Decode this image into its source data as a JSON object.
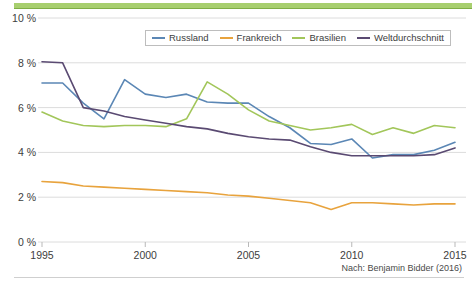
{
  "chart_data": {
    "type": "line",
    "title": "",
    "subtitle": "",
    "xlabel": "",
    "ylabel": "",
    "xlim": [
      1995,
      2015
    ],
    "ylim": [
      0,
      10
    ],
    "grid": true,
    "legend_position": "top-center",
    "x": [
      1995,
      1996,
      1997,
      1998,
      1999,
      2000,
      2001,
      2002,
      2003,
      2004,
      2005,
      2006,
      2007,
      2008,
      2009,
      2010,
      2011,
      2012,
      2013,
      2014,
      2015
    ],
    "xtick_labels": [
      "1995",
      "2000",
      "2005",
      "2010",
      "2015"
    ],
    "xticks": [
      1995,
      2000,
      2005,
      2010,
      2015
    ],
    "ytick_labels": [
      "0 %",
      "2 %",
      "4 %",
      "6 %",
      "8 %",
      "10 %"
    ],
    "yticks": [
      0,
      2,
      4,
      6,
      8,
      10
    ],
    "series": [
      {
        "name": "Russland",
        "color": "#5b87b5",
        "values": [
          7.1,
          7.1,
          6.2,
          5.5,
          7.25,
          6.6,
          6.45,
          6.6,
          6.25,
          6.2,
          6.2,
          5.6,
          5.1,
          4.4,
          4.35,
          4.6,
          3.75,
          3.9,
          3.9,
          4.1,
          4.45
        ]
      },
      {
        "name": "Frankreich",
        "color": "#e8a33d",
        "values": [
          2.7,
          2.65,
          2.5,
          2.45,
          2.4,
          2.35,
          2.3,
          2.25,
          2.2,
          2.1,
          2.05,
          1.95,
          1.85,
          1.75,
          1.45,
          1.75,
          1.75,
          1.7,
          1.65,
          1.7,
          1.7
        ]
      },
      {
        "name": "Brasilien",
        "color": "#a2c65a",
        "values": [
          5.8,
          5.4,
          5.2,
          5.15,
          5.2,
          5.2,
          5.15,
          5.5,
          7.15,
          6.6,
          5.9,
          5.4,
          5.2,
          5.0,
          5.1,
          5.25,
          4.8,
          5.1,
          4.85,
          5.2,
          5.1
        ]
      },
      {
        "name": "Weltdurchschnitt",
        "color": "#5a4a72",
        "values": [
          8.05,
          8.0,
          6.0,
          5.85,
          5.6,
          5.45,
          5.3,
          5.15,
          5.05,
          4.85,
          4.7,
          4.6,
          4.55,
          4.25,
          4.0,
          3.85,
          3.85,
          3.85,
          3.85,
          3.9,
          4.2
        ]
      }
    ]
  },
  "legend": {
    "items": [
      {
        "label": "Russland",
        "color": "#5b87b5"
      },
      {
        "label": "Frankreich",
        "color": "#e8a33d"
      },
      {
        "label": "Brasilien",
        "color": "#a2c65a"
      },
      {
        "label": "Weltdurchschnitt",
        "color": "#5a4a72"
      }
    ]
  },
  "footer": {
    "source": "Nach: Benjamin Bidder (2016)"
  },
  "axes": {
    "y": [
      {
        "label": "10 %",
        "value": 10
      },
      {
        "label": "8 %",
        "value": 8
      },
      {
        "label": "6 %",
        "value": 6
      },
      {
        "label": "4 %",
        "value": 4
      },
      {
        "label": "2 %",
        "value": 2
      },
      {
        "label": "0 %",
        "value": 0
      }
    ],
    "x": [
      {
        "label": "1995",
        "value": 1995
      },
      {
        "label": "2000",
        "value": 2000
      },
      {
        "label": "2005",
        "value": 2005
      },
      {
        "label": "2010",
        "value": 2010
      },
      {
        "label": "2015",
        "value": 2015
      }
    ]
  },
  "colors": {
    "accent_band": "#a8cf6f",
    "grid": "#dcdcdc",
    "text": "#3d3d3d"
  }
}
